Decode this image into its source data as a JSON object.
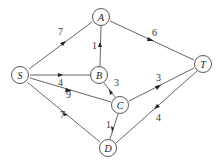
{
  "diagram": {
    "type": "directed-weighted-network",
    "nodes": [
      {
        "id": "S",
        "label": "S",
        "x": 20,
        "y": 75
      },
      {
        "id": "A",
        "label": "A",
        "x": 101,
        "y": 17
      },
      {
        "id": "B",
        "label": "B",
        "x": 99,
        "y": 75
      },
      {
        "id": "C",
        "label": "C",
        "x": 120,
        "y": 105
      },
      {
        "id": "T",
        "label": "T",
        "x": 203,
        "y": 64
      },
      {
        "id": "D",
        "label": "D",
        "x": 108,
        "y": 148
      }
    ],
    "edges": [
      {
        "from": "S",
        "to": "A",
        "weight": "7"
      },
      {
        "from": "S",
        "to": "B",
        "weight": "4"
      },
      {
        "from": "S",
        "to": "C",
        "weight": "9"
      },
      {
        "from": "S",
        "to": "D",
        "weight": "7"
      },
      {
        "from": "B",
        "to": "A",
        "weight": "1"
      },
      {
        "from": "A",
        "to": "T",
        "weight": "6"
      },
      {
        "from": "C",
        "to": "B",
        "weight": "3"
      },
      {
        "from": "C",
        "to": "D",
        "weight": "1"
      },
      {
        "from": "C",
        "to": "T",
        "weight": "3"
      },
      {
        "from": "T",
        "to": "D",
        "weight": "4"
      }
    ]
  }
}
